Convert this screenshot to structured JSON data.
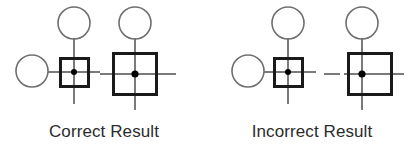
{
  "figure": {
    "width": 416,
    "height": 151,
    "background_color": "#ffffff",
    "stroke_color_thin": "#7a7a7a",
    "stroke_color_thick": "#1a1a1a",
    "dot_color": "#000000",
    "text_color": "#2b2b2b"
  },
  "panels": [
    {
      "id": "correct",
      "caption": "Correct Result",
      "shapes": {
        "free_circle": {
          "cx": 32,
          "cy": 71,
          "r": 16
        },
        "top_circle_left": {
          "cx": 74,
          "cy": 23,
          "r": 16
        },
        "small_square": {
          "x": 60,
          "y": 58,
          "w": 29,
          "h": 29
        },
        "small_square_dot": {
          "cx": 74,
          "cy": 72,
          "r": 3
        },
        "top_circle_right": {
          "cx": 135,
          "cy": 23,
          "r": 16
        },
        "large_square": {
          "x": 113,
          "y": 53,
          "w": 44,
          "h": 42
        },
        "large_square_dot": {
          "cx": 135,
          "cy": 74,
          "r": 3.5
        }
      },
      "alignment_note": "dot centered in large square"
    },
    {
      "id": "incorrect",
      "caption": "Incorrect Result",
      "shapes": {
        "free_circle": {
          "cx": 248,
          "cy": 71,
          "r": 16
        },
        "top_circle_left": {
          "cx": 288,
          "cy": 23,
          "r": 16
        },
        "small_square": {
          "x": 274,
          "y": 58,
          "w": 29,
          "h": 29
        },
        "small_square_dot": {
          "cx": 288,
          "cy": 72,
          "r": 3
        },
        "top_circle_right": {
          "cx": 362,
          "cy": 23,
          "r": 16
        },
        "large_square": {
          "x": 348,
          "y": 53,
          "w": 44,
          "h": 42
        },
        "large_square_dot": {
          "cx": 362,
          "cy": 74,
          "r": 3.5
        }
      },
      "alignment_note": "dot offset left of large square center"
    }
  ]
}
